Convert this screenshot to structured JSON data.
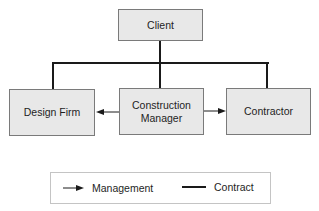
{
  "diagram": {
    "type": "organizational-chart",
    "nodes": [
      {
        "id": "client",
        "label": "Client"
      },
      {
        "id": "design_firm",
        "label": "Design Firm"
      },
      {
        "id": "construction_manager",
        "label_line1": "Construction",
        "label_line2": "Manager"
      },
      {
        "id": "contractor",
        "label": "Contractor"
      }
    ],
    "edges": [
      {
        "from": "client",
        "to": "design_firm",
        "type": "contract"
      },
      {
        "from": "client",
        "to": "construction_manager",
        "type": "contract"
      },
      {
        "from": "client",
        "to": "contractor",
        "type": "contract"
      },
      {
        "from": "construction_manager",
        "to": "design_firm",
        "type": "management"
      },
      {
        "from": "construction_manager",
        "to": "contractor",
        "type": "management"
      }
    ]
  },
  "legend": {
    "management_label": "Management",
    "contract_label": "Contract"
  },
  "colors": {
    "box_fill": "#e8e8e8",
    "box_border": "#7a7a7a",
    "line": "#1a1a1a"
  }
}
